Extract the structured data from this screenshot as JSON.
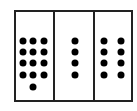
{
  "diagram": {
    "colors": {
      "stroke": "#222222",
      "dot": "#000000",
      "background": "#ffffff"
    },
    "frame": {
      "x": 14,
      "y": 10,
      "width": 119,
      "height": 92
    },
    "dividers_x": [
      53,
      93
    ],
    "panels": [
      {
        "name": "left-panel",
        "dot_count": 13,
        "dots": [
          [
            23,
            41
          ],
          [
            33,
            41
          ],
          [
            44,
            41
          ],
          [
            23,
            52
          ],
          [
            33,
            52
          ],
          [
            44,
            52
          ],
          [
            23,
            63
          ],
          [
            33,
            63
          ],
          [
            44,
            63
          ],
          [
            23,
            75
          ],
          [
            33,
            75
          ],
          [
            44,
            75
          ],
          [
            33,
            87
          ]
        ]
      },
      {
        "name": "middle-panel",
        "dot_count": 4,
        "dots": [
          [
            75,
            41
          ],
          [
            75,
            52
          ],
          [
            75,
            63
          ],
          [
            75,
            75
          ]
        ]
      },
      {
        "name": "right-panel",
        "dot_count": 8,
        "dots": [
          [
            104,
            41
          ],
          [
            121,
            41
          ],
          [
            104,
            52
          ],
          [
            121,
            52
          ],
          [
            104,
            63
          ],
          [
            121,
            63
          ],
          [
            104,
            75
          ],
          [
            121,
            75
          ]
        ]
      }
    ]
  }
}
